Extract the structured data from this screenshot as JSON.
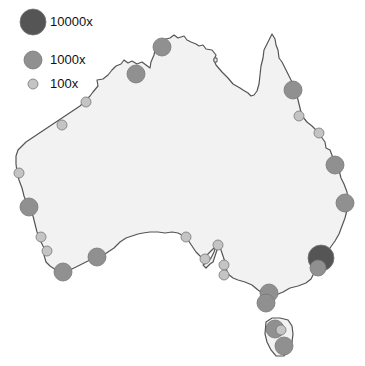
{
  "legend": {
    "items": [
      {
        "label": "10000x",
        "size": "large",
        "color": "#555555",
        "cx": 33,
        "cy": 22,
        "r": 13,
        "lx": 50,
        "ly": 14
      },
      {
        "label": "1000x",
        "size": "medium",
        "color": "#909090",
        "cx": 33,
        "cy": 60,
        "r": 9,
        "lx": 50,
        "ly": 52
      },
      {
        "label": "100x",
        "size": "small",
        "color": "#c4c4c4",
        "cx": 33,
        "cy": 84,
        "r": 5,
        "lx": 50,
        "ly": 76
      }
    ]
  },
  "colors": {
    "land": "#f2f2f2",
    "coast": "#555555",
    "large": "#555555",
    "medium": "#909090",
    "small": "#c4c4c4",
    "stroke": "#777777"
  },
  "markers": [
    {
      "size": "medium",
      "cx": 162,
      "cy": 47,
      "r": 9
    },
    {
      "size": "medium",
      "cx": 136,
      "cy": 74,
      "r": 9
    },
    {
      "size": "small",
      "cx": 86,
      "cy": 102,
      "r": 5
    },
    {
      "size": "small",
      "cx": 62,
      "cy": 125,
      "r": 5
    },
    {
      "size": "medium",
      "cx": 293,
      "cy": 90,
      "r": 9
    },
    {
      "size": "small",
      "cx": 299,
      "cy": 116,
      "r": 5
    },
    {
      "size": "small",
      "cx": 319,
      "cy": 133,
      "r": 5
    },
    {
      "size": "medium",
      "cx": 335,
      "cy": 165,
      "r": 9
    },
    {
      "size": "medium",
      "cx": 345,
      "cy": 203,
      "r": 9
    },
    {
      "size": "small",
      "cx": 19,
      "cy": 173,
      "r": 5
    },
    {
      "size": "medium",
      "cx": 29,
      "cy": 207,
      "r": 9
    },
    {
      "size": "small",
      "cx": 41,
      "cy": 237,
      "r": 5
    },
    {
      "size": "small",
      "cx": 47,
      "cy": 251,
      "r": 5
    },
    {
      "size": "medium",
      "cx": 63,
      "cy": 272,
      "r": 9
    },
    {
      "size": "medium",
      "cx": 97,
      "cy": 257,
      "r": 9
    },
    {
      "size": "small",
      "cx": 186,
      "cy": 237,
      "r": 5
    },
    {
      "size": "small",
      "cx": 218,
      "cy": 245,
      "r": 5
    },
    {
      "size": "small",
      "cx": 205,
      "cy": 259,
      "r": 5
    },
    {
      "size": "small",
      "cx": 224,
      "cy": 265,
      "r": 5
    },
    {
      "size": "small",
      "cx": 224,
      "cy": 275,
      "r": 5
    },
    {
      "size": "large",
      "cx": 321,
      "cy": 258,
      "r": 13
    },
    {
      "size": "medium",
      "cx": 318,
      "cy": 268,
      "r": 8
    },
    {
      "size": "medium",
      "cx": 269,
      "cy": 293,
      "r": 9
    },
    {
      "size": "medium",
      "cx": 266,
      "cy": 303,
      "r": 9
    },
    {
      "size": "medium",
      "cx": 275,
      "cy": 329,
      "r": 9
    },
    {
      "size": "small",
      "cx": 281,
      "cy": 330,
      "r": 5
    },
    {
      "size": "medium",
      "cx": 284,
      "cy": 346,
      "r": 9
    }
  ]
}
